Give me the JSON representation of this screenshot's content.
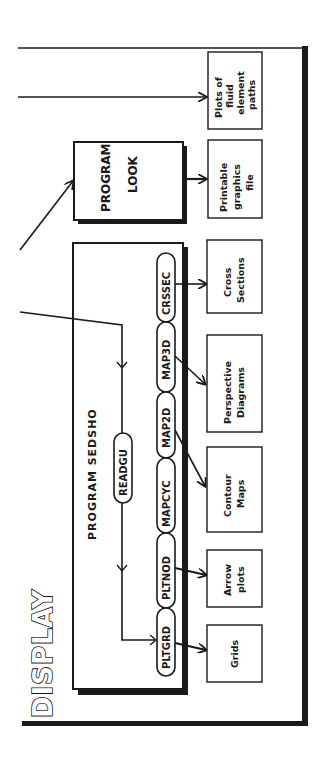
{
  "title": "DISPLAY",
  "programs": {
    "look": {
      "line1": "PROGRAM",
      "line2": "LOOK"
    },
    "sedsho": {
      "label": "PROGRAM SEDSHO",
      "reader": "READGU",
      "subroutines": [
        "CRSSEC",
        "MAP3D",
        "MAP2D",
        "MAPCYC",
        "PLTNOD",
        "PLTGRD"
      ]
    }
  },
  "outputs": [
    {
      "lines": [
        "Plots of",
        "fluid",
        "element",
        "paths"
      ]
    },
    {
      "lines": [
        "Printable",
        "graphics",
        "file"
      ]
    },
    {
      "lines": [
        "Cross",
        "Sections"
      ]
    },
    {
      "lines": [
        "Perspective",
        "Diagrams"
      ]
    },
    {
      "lines": [
        "Contour",
        "Maps"
      ]
    },
    {
      "lines": [
        "Arrow",
        "plots"
      ]
    },
    {
      "lines": [
        "Grids"
      ]
    }
  ],
  "colors": {
    "ink": "#1a1a1a",
    "background": "#ffffff"
  }
}
